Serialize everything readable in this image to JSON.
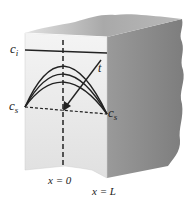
{
  "diagram": {
    "type": "slab concentration profile",
    "labels": {
      "ci": "c",
      "ci_sub": "i",
      "cs_left": "c",
      "cs_left_sub": "s",
      "cs_right": "c",
      "cs_right_sub": "s",
      "time": "t",
      "x0": "x = 0",
      "xL": "x = L"
    },
    "colors": {
      "front_face": "#ececec",
      "top_face": "#bdbdbd",
      "side_face": "#8f8f8f",
      "ink": "#222222"
    },
    "curves": {
      "count": 3,
      "description": "parabolic concentration profiles decreasing with time t"
    }
  }
}
